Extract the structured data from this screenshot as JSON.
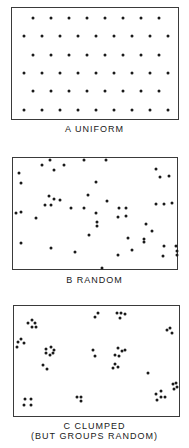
{
  "panels": [
    {
      "id": "uniform",
      "caption": "A  UNIFORM",
      "box": {
        "left": 11,
        "top": 7,
        "width": 168,
        "height": 113
      },
      "caption_top": 124,
      "dots": [
        [
          32,
          17
        ],
        [
          50,
          17
        ],
        [
          68,
          17
        ],
        [
          86,
          17
        ],
        [
          104,
          17
        ],
        [
          122,
          17
        ],
        [
          140,
          17
        ],
        [
          158,
          17
        ],
        [
          23,
          35
        ],
        [
          41,
          35
        ],
        [
          59,
          35
        ],
        [
          77,
          35
        ],
        [
          95,
          35
        ],
        [
          113,
          35
        ],
        [
          131,
          35
        ],
        [
          149,
          35
        ],
        [
          167,
          35
        ],
        [
          32,
          54
        ],
        [
          50,
          54
        ],
        [
          68,
          54
        ],
        [
          86,
          54
        ],
        [
          104,
          54
        ],
        [
          122,
          54
        ],
        [
          140,
          54
        ],
        [
          158,
          54
        ],
        [
          23,
          72
        ],
        [
          41,
          72
        ],
        [
          59,
          72
        ],
        [
          77,
          72
        ],
        [
          95,
          72
        ],
        [
          113,
          72
        ],
        [
          131,
          72
        ],
        [
          149,
          72
        ],
        [
          167,
          72
        ],
        [
          32,
          90
        ],
        [
          50,
          90
        ],
        [
          68,
          90
        ],
        [
          86,
          90
        ],
        [
          104,
          90
        ],
        [
          122,
          90
        ],
        [
          140,
          90
        ],
        [
          158,
          90
        ],
        [
          23,
          109
        ],
        [
          41,
          109
        ],
        [
          59,
          109
        ],
        [
          77,
          109
        ],
        [
          95,
          109
        ],
        [
          113,
          109
        ],
        [
          131,
          109
        ],
        [
          149,
          109
        ],
        [
          167,
          109
        ]
      ]
    },
    {
      "id": "random",
      "caption": "B  RANDOM",
      "box": {
        "left": 12,
        "top": 157,
        "width": 166,
        "height": 113
      },
      "caption_top": 275,
      "dots": [
        [
          49,
          159
        ],
        [
          83,
          159
        ],
        [
          105,
          159
        ],
        [
          41,
          164
        ],
        [
          63,
          164
        ],
        [
          53,
          169
        ],
        [
          18,
          172
        ],
        [
          20,
          182
        ],
        [
          155,
          168
        ],
        [
          159,
          176
        ],
        [
          168,
          175
        ],
        [
          95,
          181
        ],
        [
          48,
          195
        ],
        [
          87,
          194
        ],
        [
          53,
          198
        ],
        [
          59,
          199
        ],
        [
          44,
          204
        ],
        [
          50,
          204
        ],
        [
          106,
          200
        ],
        [
          15,
          212
        ],
        [
          20,
          211
        ],
        [
          70,
          207
        ],
        [
          83,
          207
        ],
        [
          95,
          212
        ],
        [
          118,
          207
        ],
        [
          125,
          207
        ],
        [
          155,
          203
        ],
        [
          163,
          203
        ],
        [
          171,
          202
        ],
        [
          35,
          217
        ],
        [
          117,
          216
        ],
        [
          125,
          215
        ],
        [
          96,
          221
        ],
        [
          96,
          225
        ],
        [
          145,
          223
        ],
        [
          88,
          234
        ],
        [
          151,
          230
        ],
        [
          127,
          237
        ],
        [
          143,
          238
        ],
        [
          143,
          241
        ],
        [
          20,
          242
        ],
        [
          50,
          247
        ],
        [
          74,
          251
        ],
        [
          131,
          249
        ],
        [
          117,
          254
        ],
        [
          163,
          245
        ],
        [
          175,
          245
        ],
        [
          176,
          250
        ],
        [
          162,
          255
        ],
        [
          176,
          254
        ],
        [
          101,
          267
        ]
      ]
    },
    {
      "id": "clumped",
      "caption_line1": "C  CLUMPED",
      "caption_line2": "(BUT GROUPS RANDOM)",
      "box": {
        "left": 13,
        "top": 305,
        "width": 167,
        "height": 112
      },
      "caption_top": 421,
      "dots": [
        [
          27,
          322
        ],
        [
          31,
          319
        ],
        [
          34,
          322
        ],
        [
          31,
          326
        ],
        [
          35,
          326
        ],
        [
          17,
          341
        ],
        [
          20,
          338
        ],
        [
          23,
          342
        ],
        [
          16,
          346
        ],
        [
          45,
          348
        ],
        [
          50,
          346
        ],
        [
          53,
          349
        ],
        [
          45,
          352
        ],
        [
          49,
          354
        ],
        [
          52,
          352
        ],
        [
          42,
          364
        ],
        [
          46,
          368
        ],
        [
          94,
          316
        ],
        [
          97,
          312
        ],
        [
          116,
          312
        ],
        [
          120,
          312
        ],
        [
          124,
          313
        ],
        [
          119,
          317
        ],
        [
          92,
          349
        ],
        [
          94,
          355
        ],
        [
          117,
          347
        ],
        [
          121,
          350
        ],
        [
          124,
          349
        ],
        [
          114,
          354
        ],
        [
          118,
          355
        ],
        [
          114,
          363
        ],
        [
          117,
          366
        ],
        [
          112,
          367
        ],
        [
          166,
          329
        ],
        [
          169,
          327
        ],
        [
          171,
          332
        ],
        [
          147,
          372
        ],
        [
          172,
          383
        ],
        [
          175,
          382
        ],
        [
          176,
          386
        ],
        [
          173,
          388
        ],
        [
          155,
          393
        ],
        [
          160,
          390
        ],
        [
          164,
          396
        ],
        [
          156,
          399
        ],
        [
          160,
          396
        ],
        [
          76,
          396
        ],
        [
          80,
          396
        ],
        [
          80,
          400
        ],
        [
          24,
          398
        ],
        [
          30,
          398
        ],
        [
          23,
          404
        ],
        [
          30,
          404
        ]
      ]
    }
  ]
}
